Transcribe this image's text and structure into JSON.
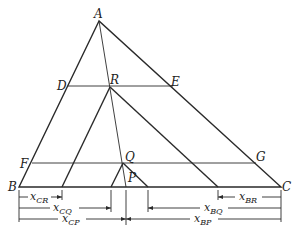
{
  "diagram": {
    "type": "geometric construction",
    "points": {
      "A": {
        "label": "A",
        "x": 99,
        "y": 21
      },
      "B": {
        "label": "B",
        "x": 19,
        "y": 187
      },
      "C": {
        "label": "C",
        "x": 281,
        "y": 187
      },
      "D": {
        "label": "D",
        "x": 68,
        "y": 86
      },
      "E": {
        "label": "E",
        "x": 173,
        "y": 86
      },
      "R": {
        "label": "R",
        "x": 110,
        "y": 87
      },
      "F": {
        "label": "F",
        "x": 32,
        "y": 163
      },
      "G": {
        "label": "G",
        "x": 256,
        "y": 163
      },
      "Q": {
        "label": "Q",
        "x": 123,
        "y": 163
      },
      "P": {
        "label": "P",
        "x": 126,
        "y": 187
      }
    },
    "dimensions": [
      {
        "name": "x_CR",
        "base": "x",
        "sub": "CR"
      },
      {
        "name": "x_CQ",
        "base": "x",
        "sub": "CQ"
      },
      {
        "name": "x_CP",
        "base": "x",
        "sub": "CP"
      },
      {
        "name": "x_BR",
        "base": "x",
        "sub": "BR"
      },
      {
        "name": "x_BQ",
        "base": "x",
        "sub": "BQ"
      },
      {
        "name": "x_BP",
        "base": "x",
        "sub": "BP"
      }
    ]
  }
}
